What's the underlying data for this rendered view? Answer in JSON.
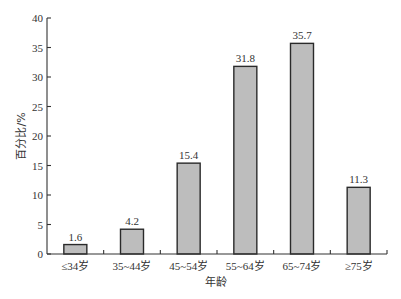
{
  "chart_data": {
    "type": "bar",
    "title": "",
    "xlabel": "年龄",
    "ylabel": "百分比/%",
    "categories": [
      "≤34岁",
      "35~44岁",
      "45~54岁",
      "55~64岁",
      "65~74岁",
      "≥75岁"
    ],
    "values": [
      1.6,
      4.2,
      15.4,
      31.8,
      35.7,
      11.3
    ],
    "value_labels": [
      "1.6",
      "4.2",
      "15.4",
      "31.8",
      "35.7",
      "11.3"
    ],
    "ylim": [
      0,
      40
    ],
    "yticks": [
      0,
      5,
      10,
      15,
      20,
      25,
      30,
      35,
      40
    ],
    "grid": false,
    "legend": null,
    "colors": {
      "bar_fill": "#bdbdbd",
      "bar_stroke": "#2a2a2a",
      "axis": "#333333"
    }
  }
}
